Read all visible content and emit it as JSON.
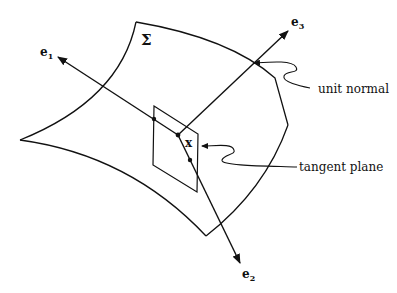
{
  "diagram": {
    "surface_label": "Σ",
    "point_label": "x",
    "vectors": [
      {
        "name": "e",
        "index": "1"
      },
      {
        "name": "e",
        "index": "2"
      },
      {
        "name": "e",
        "index": "3"
      }
    ],
    "annotations": {
      "unit_normal": "unit normal",
      "tangent_plane": "tangent plane"
    },
    "colors": {
      "ink": "#111111",
      "background": "#ffffff"
    }
  }
}
